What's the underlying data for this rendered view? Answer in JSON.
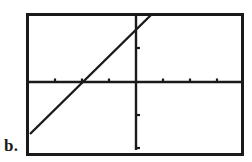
{
  "figure": {
    "label": "b.",
    "kind": "calculator-graph-screen"
  },
  "colors": {
    "ink": "#1a1a1a",
    "background": "#ffffff",
    "frame": "#1a1a1a"
  },
  "frame": {
    "x": 26,
    "y": 13,
    "width": 218,
    "height": 143,
    "border_width": 3
  },
  "chart_data": {
    "type": "line",
    "title": "",
    "subtitle": "",
    "xlabel": "",
    "ylabel": "",
    "grid": false,
    "legend": null,
    "annotations": [],
    "axes": {
      "x_axis": {
        "pixel_y": 82,
        "pixel_x_start": 27,
        "pixel_x_end": 243,
        "tick_spacing_px": 27,
        "tick_pixel_positions": [
          55,
          82,
          109,
          163,
          190,
          217
        ],
        "tick_labels": [],
        "xlim": [
          -4.1,
          4.0
        ]
      },
      "y_axis": {
        "pixel_x": 136,
        "pixel_y_start": 14,
        "pixel_y_end": 150,
        "tick_spacing_px": 33,
        "tick_pixel_positions": [
          48,
          115,
          148
        ],
        "tick_labels": [],
        "ylim": [
          -2.1,
          2.1
        ]
      },
      "origin_pixel": {
        "x": 136,
        "y": 82
      }
    },
    "series": [
      {
        "name": "line",
        "style": "solid",
        "equation_note": "y = x + 1",
        "slope_units": 1.0,
        "x_intercept_units": -1.0,
        "y_intercept_units": 1.0,
        "pixel_endpoints": [
          {
            "x": 30,
            "y": 134
          },
          {
            "x": 152,
            "y": 14
          }
        ],
        "x": [
          -3.93,
          0.59
        ],
        "y": [
          -1.58,
          2.06
        ]
      }
    ]
  }
}
